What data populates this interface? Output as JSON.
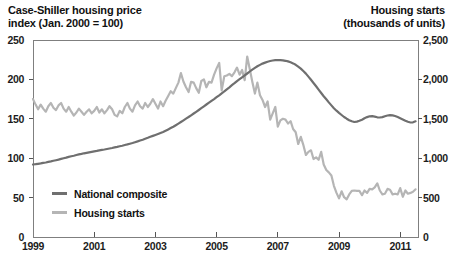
{
  "left_title": {
    "line1": "Case-Shiller housing price",
    "line2": "index (Jan. 2000 = 100)"
  },
  "right_title": {
    "line1": "Housing starts",
    "line2": "(thousands of units)"
  },
  "legend": [
    {
      "label": "National composite",
      "color": "#6f6f6f"
    },
    {
      "label": "Housing starts",
      "color": "#b5b5b5"
    }
  ],
  "colors": {
    "frame": "#7f7f7f",
    "tick": "#555555",
    "text": "#1c1c1c"
  },
  "chart_data": {
    "type": "line",
    "grid": false,
    "legend_position": "inside lower-left",
    "x_axis": {
      "min": 1999,
      "max": 2011.58,
      "tick_values": [
        1999,
        2001,
        2003,
        2005,
        2007,
        2009,
        2011
      ],
      "tick_labels": [
        "1999",
        "2001",
        "2003",
        "2005",
        "2007",
        "2009",
        "2011"
      ]
    },
    "left_axis": {
      "label": "Case-Shiller housing price index (Jan. 2000 = 100)",
      "min": 0,
      "max": 250,
      "tick_values": [
        250,
        200,
        150,
        100,
        50,
        0
      ],
      "tick_labels": [
        "250",
        "200",
        "150",
        "100",
        "50",
        "0"
      ]
    },
    "right_axis": {
      "label": "Housing starts (thousands of units)",
      "min": 0,
      "max": 2500,
      "tick_values": [
        2500,
        2000,
        1500,
        1000,
        500,
        0
      ],
      "tick_labels": [
        "2,500",
        "2,000",
        "1,500",
        "1,000",
        "500",
        "0"
      ]
    },
    "series": [
      {
        "name": "National composite",
        "axis": "left",
        "color": "#6f6f6f",
        "x_start": 1999,
        "x_step": 0.0833333,
        "values": [
          92.0,
          92.4,
          92.9,
          93.4,
          94.0,
          94.6,
          95.3,
          96.0,
          96.7,
          97.4,
          98.2,
          99.1,
          100.0,
          100.8,
          101.6,
          102.4,
          103.2,
          104.0,
          104.8,
          105.5,
          106.2,
          106.9,
          107.5,
          108.1,
          108.7,
          109.3,
          109.9,
          110.5,
          111.1,
          111.7,
          112.3,
          113.0,
          113.7,
          114.4,
          115.1,
          115.9,
          116.7,
          117.5,
          118.4,
          119.3,
          120.3,
          121.3,
          122.4,
          123.5,
          124.7,
          125.9,
          127.1,
          128.3,
          129.5,
          130.7,
          132.0,
          133.4,
          134.9,
          136.5,
          138.2,
          140.0,
          141.9,
          143.9,
          146.0,
          148.1,
          150.2,
          152.3,
          154.5,
          156.7,
          158.9,
          161.2,
          163.5,
          165.8,
          168.1,
          170.4,
          172.7,
          175.0,
          177.4,
          179.8,
          182.3,
          184.8,
          187.4,
          190.0,
          192.6,
          195.2,
          197.8,
          200.3,
          202.7,
          205.1,
          207.5,
          210.0,
          212.4,
          214.6,
          216.6,
          218.4,
          220.0,
          221.3,
          222.4,
          223.3,
          224.0,
          224.4,
          224.6,
          224.5,
          224.2,
          223.6,
          222.8,
          221.7,
          220.3,
          218.5,
          216.3,
          213.7,
          210.7,
          207.3,
          203.5,
          199.5,
          195.4,
          191.2,
          187.0,
          182.8,
          178.7,
          174.7,
          170.8,
          167.0,
          163.4,
          160.3,
          157.5,
          154.8,
          152.3,
          150.1,
          148.2,
          146.8,
          146.0,
          146.4,
          147.4,
          148.9,
          150.7,
          152.2,
          153.2,
          153.4,
          152.8,
          151.9,
          151.6,
          152.2,
          153.3,
          154.2,
          154.6,
          154.3,
          153.5,
          152.3,
          150.8,
          149.2,
          147.6,
          146.2,
          145.3,
          145.6,
          146.8
        ]
      },
      {
        "name": "Housing starts",
        "axis": "right",
        "color": "#b5b5b5",
        "x_start": 1999,
        "x_step": 0.0833333,
        "values": [
          1750,
          1680,
          1620,
          1680,
          1630,
          1590,
          1660,
          1700,
          1640,
          1610,
          1670,
          1700,
          1630,
          1590,
          1650,
          1590,
          1540,
          1580,
          1630,
          1590,
          1550,
          1590,
          1620,
          1570,
          1600,
          1650,
          1580,
          1620,
          1570,
          1610,
          1660,
          1620,
          1550,
          1530,
          1600,
          1570,
          1650,
          1700,
          1630,
          1590,
          1670,
          1720,
          1660,
          1630,
          1700,
          1650,
          1690,
          1750,
          1690,
          1630,
          1720,
          1660,
          1730,
          1790,
          1850,
          1820,
          1890,
          1960,
          2080,
          1970,
          1900,
          1840,
          1970,
          1960,
          1890,
          1830,
          1980,
          2000,
          1900,
          1970,
          1960,
          2060,
          2140,
          2210,
          1860,
          2040,
          2050,
          2070,
          2040,
          2090,
          2150,
          2060,
          2120,
          1990,
          2290,
          2130,
          1970,
          1820,
          1960,
          1800,
          1740,
          1650,
          1720,
          1490,
          1570,
          1650,
          1400,
          1480,
          1500,
          1490,
          1440,
          1470,
          1370,
          1330,
          1180,
          1270,
          1170,
          1040,
          1080,
          1100,
          990,
          1010,
          980,
          1080,
          920,
          850,
          820,
          780,
          650,
          560,
          490,
          580,
          505,
          478,
          540,
          585,
          590,
          585,
          585,
          530,
          590,
          560,
          610,
          605,
          630,
          680,
          590,
          540,
          550,
          610,
          600,
          540,
          550,
          540,
          620,
          510,
          590,
          550,
          560,
          575,
          605
        ]
      }
    ]
  }
}
